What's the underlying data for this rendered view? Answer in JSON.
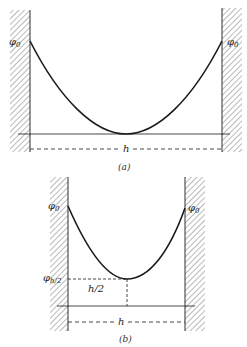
{
  "figure_a": {
    "caption": "(a)",
    "left_label": "φ",
    "left_label_sub": "0",
    "right_label": "φ",
    "right_label_sub": "0",
    "width_label": "h"
  },
  "figure_b": {
    "caption": "(b)",
    "left_label": "φ",
    "left_label_sub": "0",
    "right_label": "φ",
    "right_label_sub": "0",
    "mid_label": "φ",
    "mid_label_sub": "h/2",
    "half_width_label": "h/2",
    "width_label": "h"
  },
  "colors": {
    "line": "#1a1a1a",
    "hatch": "#888888"
  }
}
